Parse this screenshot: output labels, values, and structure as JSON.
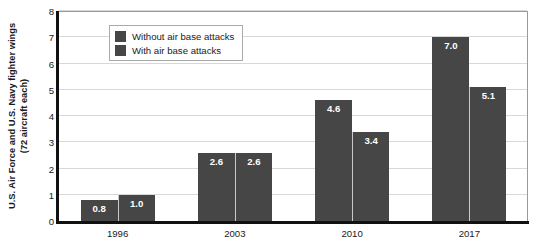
{
  "chart_data": {
    "type": "bar",
    "title": "",
    "subtitle": "",
    "xlabel": "",
    "ylabel": "U.S. Air Force and U.S. Navy fighter wings (72 aircraft each)",
    "ylabel_lines": [
      "U.S. Air Force and U.S. Navy fighter wings",
      "(72 aircraft each)"
    ],
    "categories": [
      "1996",
      "2003",
      "2010",
      "2017"
    ],
    "series": [
      {
        "name": "Without air base attacks",
        "color": "#464646",
        "values": [
          0.8,
          2.6,
          4.6,
          7.0
        ],
        "labels": [
          "0.8",
          "2.6",
          "4.6",
          "7.0"
        ]
      },
      {
        "name": "With air base attacks",
        "color": "#464646",
        "values": [
          1.0,
          2.6,
          3.4,
          5.1
        ],
        "labels": [
          "1.0",
          "2.6",
          "3.4",
          "5.1"
        ]
      }
    ],
    "ylim": [
      0,
      8
    ],
    "yticks": [
      0,
      1,
      2,
      3,
      4,
      5,
      6,
      7,
      8
    ],
    "ytick_labels": [
      "0",
      "1",
      "2",
      "3",
      "4",
      "5",
      "6",
      "7",
      "8"
    ],
    "grid": true,
    "grid_axis": "y",
    "legend_position": "upper left",
    "legend_entries": [
      "Without air base attacks",
      "With air base attacks"
    ]
  }
}
